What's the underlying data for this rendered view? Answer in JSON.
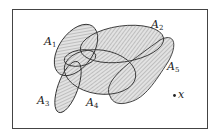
{
  "diagram": {
    "type": "venn-style set diagram",
    "frame": {
      "stroke": "#444444"
    },
    "sets": [
      {
        "name": "A",
        "subscript": "1",
        "label": "A1"
      },
      {
        "name": "A",
        "subscript": "2",
        "label": "A2"
      },
      {
        "name": "A",
        "subscript": "3",
        "label": "A3"
      },
      {
        "name": "A",
        "subscript": "4",
        "label": "A4"
      },
      {
        "name": "A",
        "subscript": "5",
        "label": "A5"
      }
    ],
    "point": {
      "label": "x"
    },
    "colors": {
      "outline": "#333333",
      "hatch": "#8a8a8a",
      "fill": "#d8d8d8"
    }
  }
}
